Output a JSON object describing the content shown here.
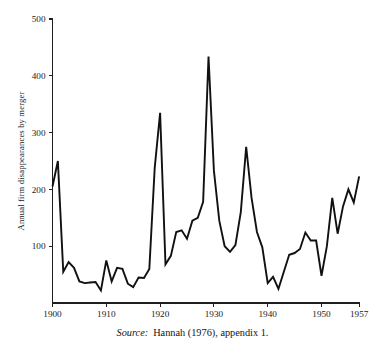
{
  "figure": {
    "source_prefix": "Source:",
    "source_text": "Hannah (1976), appendix 1."
  },
  "chart_data": {
    "type": "line",
    "title": "",
    "xlabel": "",
    "ylabel": "Annual firm disappearances by merger",
    "xlim": [
      1900,
      1957
    ],
    "ylim": [
      0,
      500
    ],
    "grid": false,
    "legend": false,
    "xticks": [
      1900,
      1910,
      1920,
      1930,
      1940,
      1950,
      1957
    ],
    "xtick_labels": [
      "1900",
      "1910",
      "1920",
      "1930",
      "1940",
      "1950",
      "1957"
    ],
    "yticks": [
      100,
      200,
      300,
      400,
      500
    ],
    "ytick_labels": [
      "100",
      "200",
      "300",
      "400",
      "500"
    ],
    "line_color": "#111111",
    "x": [
      1900,
      1901,
      1902,
      1903,
      1904,
      1905,
      1906,
      1907,
      1908,
      1909,
      1910,
      1911,
      1912,
      1913,
      1914,
      1915,
      1916,
      1917,
      1918,
      1919,
      1920,
      1921,
      1922,
      1923,
      1924,
      1925,
      1926,
      1927,
      1928,
      1929,
      1930,
      1931,
      1932,
      1933,
      1934,
      1935,
      1936,
      1937,
      1938,
      1939,
      1940,
      1941,
      1942,
      1943,
      1944,
      1945,
      1946,
      1947,
      1948,
      1949,
      1950,
      1951,
      1952,
      1953,
      1954,
      1955,
      1956,
      1957
    ],
    "y": [
      205,
      250,
      55,
      72,
      62,
      38,
      35,
      36,
      37,
      22,
      75,
      38,
      62,
      60,
      34,
      28,
      45,
      44,
      60,
      238,
      335,
      68,
      83,
      125,
      128,
      113,
      145,
      150,
      178,
      434,
      233,
      145,
      100,
      90,
      102,
      160,
      275,
      185,
      125,
      98,
      35,
      46,
      25,
      55,
      85,
      88,
      95,
      124,
      110,
      110,
      48,
      100,
      185,
      122,
      170,
      200,
      177,
      223
    ]
  }
}
